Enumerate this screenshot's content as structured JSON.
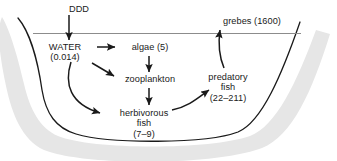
{
  "figure": {
    "colors": {
      "text": "#1a1a1a",
      "bank_line": "#1a1a1a",
      "bank_shadow": "#e6e6e6",
      "water_line": "#8c8c8c",
      "arrow": "#1a1a1a",
      "background": "#ffffff"
    }
  },
  "nodes": {
    "ddd": {
      "name": "DDD",
      "lines": [
        "DDD"
      ],
      "value": null
    },
    "water": {
      "name": "WATER",
      "lines": [
        "WATER",
        "(0.014)"
      ],
      "value": "0.014"
    },
    "algae": {
      "name": "algae",
      "lines": [
        "algae (5)"
      ],
      "value": "5"
    },
    "zooplankton": {
      "name": "zooplankton",
      "lines": [
        "zooplankton"
      ],
      "value": null
    },
    "herbivorous_fish": {
      "name": "herbivorous fish",
      "lines": [
        "herbivorous",
        "fish",
        "(7–9)"
      ],
      "value": "7–9"
    },
    "predatory_fish": {
      "name": "predatory fish",
      "lines": [
        "predatory",
        "fish",
        "(22–211)"
      ],
      "value": "22–211"
    },
    "grebes": {
      "name": "grebes",
      "lines": [
        "grebes (1600)"
      ],
      "value": "1600"
    }
  },
  "edges": [
    {
      "from": "ddd",
      "to": "water",
      "style": "straight-down"
    },
    {
      "from": "water",
      "to": "algae",
      "style": "straight-right"
    },
    {
      "from": "water",
      "to": "zooplankton",
      "style": "diagonal-down-right"
    },
    {
      "from": "water",
      "to": "herbivorous_fish",
      "style": "curved-down-right"
    },
    {
      "from": "algae",
      "to": "zooplankton",
      "style": "straight-down"
    },
    {
      "from": "zooplankton",
      "to": "herbivorous_fish",
      "style": "straight-down"
    },
    {
      "from": "herbivorous_fish",
      "to": "predatory_fish",
      "style": "curved-up-right"
    },
    {
      "from": "predatory_fish",
      "to": "grebes",
      "style": "curved-up"
    }
  ],
  "water_line": {
    "label": "water surface"
  }
}
